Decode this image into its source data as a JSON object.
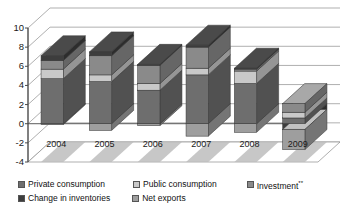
{
  "chart_data": {
    "type": "bar",
    "subtype": "stacked-column-3d",
    "title": "",
    "xlabel": "",
    "ylabel": "",
    "ylim": [
      -4,
      10
    ],
    "ytick_step": 2,
    "yticks": [
      "10",
      "8",
      "6",
      "4",
      "2",
      "0",
      "-2",
      "-4"
    ],
    "grid": true,
    "legend_position": "bottom",
    "categories": [
      "2004",
      "2005",
      "2006",
      "2007",
      "2008",
      "2009"
    ],
    "series": [
      {
        "name": "Private consumption",
        "color": "#6e6e6e",
        "values": [
          4.7,
          4.4,
          3.5,
          5.1,
          4.2,
          0.6
        ]
      },
      {
        "name": "Public consumption",
        "color": "#c9c9c9",
        "values": [
          1.0,
          0.7,
          0.7,
          0.7,
          1.3,
          0.6
        ]
      },
      {
        "name": "Investment**",
        "color": "#8a8a8a",
        "values": [
          0.9,
          2.0,
          1.9,
          2.2,
          0.2,
          0.9
        ]
      },
      {
        "name": "Change in inventories",
        "color": "#3d3d3d",
        "values": [
          0.5,
          0.4,
          0.1,
          0.2,
          0.1,
          -0.6
        ]
      },
      {
        "name": "Net exports",
        "color": "#9e9e9e",
        "values": [
          -0.1,
          -0.7,
          -0.2,
          -1.3,
          -0.9,
          -2.1
        ]
      }
    ],
    "totals": [
      7.1,
      6.8,
      6.1,
      8.0,
      5.8,
      2.1
    ],
    "negative_totals": [
      -0.1,
      -0.7,
      -0.2,
      -1.3,
      -0.9,
      -2.7
    ]
  },
  "axis": {
    "y_labels": [
      {
        "text": "10",
        "value": 10
      },
      {
        "text": "8",
        "value": 8
      },
      {
        "text": "6",
        "value": 6
      },
      {
        "text": "4",
        "value": 4
      },
      {
        "text": "2",
        "value": 2
      },
      {
        "text": "0",
        "value": 0
      },
      {
        "text": "-2",
        "value": -2
      },
      {
        "text": "-4",
        "value": -4
      }
    ],
    "x_labels": [
      "2004",
      "2005",
      "2006",
      "2007",
      "2008",
      "2009"
    ]
  },
  "legend": {
    "row1": [
      {
        "label": "Private consumption",
        "color": "#6e6e6e",
        "icon": "legend-swatch-icon"
      },
      {
        "label": "Public consumption",
        "color": "#c9c9c9",
        "icon": "legend-swatch-icon"
      },
      {
        "label": "Investment",
        "sup": "**",
        "color": "#8a8a8a",
        "icon": "legend-swatch-icon"
      }
    ],
    "row2": [
      {
        "label": "Change in inventories",
        "color": "#3d3d3d",
        "icon": "legend-swatch-icon"
      },
      {
        "label": "Net exports",
        "color": "#9e9e9e",
        "icon": "legend-swatch-icon"
      }
    ]
  },
  "colors": {
    "private_consumption": "#6e6e6e",
    "public_consumption": "#c9c9c9",
    "investment": "#8a8a8a",
    "change_in_inventories": "#3d3d3d",
    "net_exports": "#9e9e9e",
    "gridline": "#8d8d8d",
    "axis": "#4a4a4a",
    "floor": "#bdbdbd",
    "background": "#ffffff"
  }
}
